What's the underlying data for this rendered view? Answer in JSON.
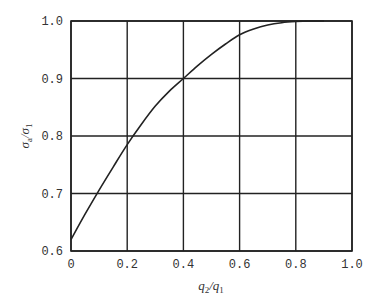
{
  "chart_data": {
    "type": "line",
    "title": "",
    "xlabel": "q2/q1",
    "ylabel": "σa/σ1",
    "xlabel_parts": {
      "main": "q",
      "sub1": "2",
      "slash": "/",
      "main2": "q",
      "sub2": "1"
    },
    "ylabel_parts": {
      "main": "σ",
      "sub1": "a",
      "slash": "/",
      "main2": "σ",
      "sub2": "1"
    },
    "xlim": [
      0,
      1.0
    ],
    "ylim": [
      0.6,
      1.0
    ],
    "x_ticks": [
      "0",
      "0.2",
      "0.4",
      "0.6",
      "0.8",
      "1.0"
    ],
    "y_ticks": [
      "0.6",
      "0.7",
      "0.8",
      "0.9",
      "1.0"
    ],
    "grid": true,
    "legend": null,
    "series": [
      {
        "name": "σa/σ1",
        "x": [
          0.0,
          0.05,
          0.1,
          0.15,
          0.2,
          0.25,
          0.3,
          0.35,
          0.4,
          0.45,
          0.5,
          0.55,
          0.6,
          0.65,
          0.7,
          0.75,
          0.8,
          0.85,
          0.9
        ],
        "y": [
          0.62,
          0.664,
          0.706,
          0.746,
          0.785,
          0.82,
          0.852,
          0.878,
          0.9,
          0.922,
          0.942,
          0.96,
          0.976,
          0.986,
          0.993,
          0.997,
          0.999,
          1.0,
          1.0
        ]
      }
    ]
  }
}
